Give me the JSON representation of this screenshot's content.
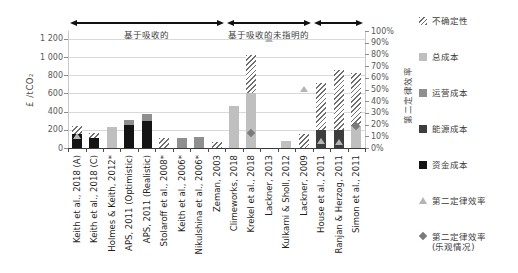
{
  "chart_data": {
    "type": "bar",
    "title": "",
    "left_axis": {
      "label": "£ /tCO₂",
      "min": 0,
      "max": 1200,
      "step": 200,
      "ticks": [
        {
          "label": "1 200",
          "value": 1200
        },
        {
          "label": "1 000",
          "value": 1000
        },
        {
          "label": "800",
          "value": 800
        },
        {
          "label": "600",
          "value": 600
        },
        {
          "label": "400",
          "value": 400
        },
        {
          "label": "200",
          "value": 200
        },
        {
          "label": "0",
          "value": 0
        }
      ]
    },
    "right_axis": {
      "label": "第二定律效率",
      "min": 0,
      "max": 100,
      "step": 10,
      "ticks": [
        {
          "label": "100%",
          "value": 100
        },
        {
          "label": "90%",
          "value": 90
        },
        {
          "label": "80%",
          "value": 80
        },
        {
          "label": "70%",
          "value": 70
        },
        {
          "label": "60%",
          "value": 60
        },
        {
          "label": "50%",
          "value": 50
        },
        {
          "label": "40%",
          "value": 40
        },
        {
          "label": "30%",
          "value": 30
        },
        {
          "label": "20%",
          "value": 20
        },
        {
          "label": "10%",
          "value": 10
        },
        {
          "label": "0%",
          "value": 0
        }
      ]
    },
    "groups": [
      {
        "label": "基于吸收的",
        "from": 0,
        "to": 8
      },
      {
        "label": "基于吸收的未指明的",
        "from": 9,
        "to": 13
      },
      {
        "label": "",
        "from": 14,
        "to": 16
      }
    ],
    "categories": [
      "Keith et al., 2018 (A)",
      "Keith et al., 2018 (C)",
      "Holmes & Keith, 2012*",
      "APS, 2011 (Optimistic)",
      "APS, 2011 (Realistic)",
      "Stolaroff et al., 2008*",
      "Keith et al., 2006*",
      "Nikulshina et al., 2006*",
      "Zeman, 2003",
      "Climeworks, 2018",
      "Krekel et al., 2018",
      "Lackner, 2013",
      "Kulkarni & Sholl, 2012",
      "Lackner, 2009",
      "House et al., 2011",
      "Ranjan & Herzog, 2011",
      "Simon et al., 2011"
    ],
    "bars": [
      {
        "category": "Keith et al., 2018 (A)",
        "segments": [
          {
            "type": "capital",
            "value": 150
          },
          {
            "type": "uncertainty",
            "value": 90
          }
        ],
        "second_law_efficiency_pct": 10,
        "second_law_efficiency_optimistic_pct": null
      },
      {
        "category": "Keith et al., 2018 (C)",
        "segments": [
          {
            "type": "capital",
            "value": 110
          },
          {
            "type": "uncertainty",
            "value": 60
          }
        ],
        "second_law_efficiency_pct": null,
        "second_law_efficiency_optimistic_pct": null
      },
      {
        "category": "Holmes & Keith, 2012*",
        "segments": [
          {
            "type": "total",
            "value": 230
          }
        ],
        "second_law_efficiency_pct": null,
        "second_law_efficiency_optimistic_pct": null
      },
      {
        "category": "APS, 2011 (Optimistic)",
        "segments": [
          {
            "type": "capital",
            "value": 250
          },
          {
            "type": "operating",
            "value": 60
          }
        ],
        "second_law_efficiency_pct": null,
        "second_law_efficiency_optimistic_pct": null
      },
      {
        "category": "APS, 2011 (Realistic)",
        "segments": [
          {
            "type": "capital",
            "value": 300
          },
          {
            "type": "operating",
            "value": 75
          }
        ],
        "second_law_efficiency_pct": null,
        "second_law_efficiency_optimistic_pct": null
      },
      {
        "category": "Stolaroff et al., 2008*",
        "segments": [
          {
            "type": "uncertainty",
            "value": 110
          }
        ],
        "second_law_efficiency_pct": null,
        "second_law_efficiency_optimistic_pct": null
      },
      {
        "category": "Keith et al., 2006*",
        "segments": [
          {
            "type": "operating",
            "value": 110
          }
        ],
        "second_law_efficiency_pct": null,
        "second_law_efficiency_optimistic_pct": null
      },
      {
        "category": "Nikulshina et al., 2006*",
        "segments": [
          {
            "type": "operating",
            "value": 125
          }
        ],
        "second_law_efficiency_pct": null,
        "second_law_efficiency_optimistic_pct": null
      },
      {
        "category": "Zeman, 2003",
        "segments": [
          {
            "type": "uncertainty",
            "value": 65
          }
        ],
        "second_law_efficiency_pct": null,
        "second_law_efficiency_optimistic_pct": null
      },
      {
        "category": "Climeworks, 2018",
        "segments": [
          {
            "type": "total",
            "value": 460
          }
        ],
        "second_law_efficiency_pct": null,
        "second_law_efficiency_optimistic_pct": null
      },
      {
        "category": "Krekel et al., 2018",
        "segments": [
          {
            "type": "total",
            "value": 600
          },
          {
            "type": "uncertainty",
            "value": 420
          }
        ],
        "second_law_efficiency_pct": null,
        "second_law_efficiency_optimistic_pct": 13
      },
      {
        "category": "Lackner, 2013",
        "segments": [],
        "second_law_efficiency_pct": 93,
        "second_law_efficiency_optimistic_pct": null
      },
      {
        "category": "Kulkarni & Sholl, 2012",
        "segments": [
          {
            "type": "total",
            "value": 80
          }
        ],
        "second_law_efficiency_pct": null,
        "second_law_efficiency_optimistic_pct": null
      },
      {
        "category": "Lackner, 2009",
        "segments": [
          {
            "type": "uncertainty",
            "value": 150
          }
        ],
        "second_law_efficiency_pct": 50,
        "second_law_efficiency_optimistic_pct": null
      },
      {
        "category": "House et al., 2011",
        "segments": [
          {
            "type": "energy",
            "value": 195
          },
          {
            "type": "uncertainty",
            "value": 520
          }
        ],
        "second_law_efficiency_pct": 6,
        "second_law_efficiency_optimistic_pct": null
      },
      {
        "category": "Ranjan & Herzog, 2011",
        "segments": [
          {
            "type": "energy",
            "value": 200
          },
          {
            "type": "uncertainty",
            "value": 660
          }
        ],
        "second_law_efficiency_pct": 5,
        "second_law_efficiency_optimistic_pct": null
      },
      {
        "category": "Simon et al., 2011",
        "segments": [
          {
            "type": "total",
            "value": 240
          },
          {
            "type": "uncertainty",
            "value": 590
          }
        ],
        "second_law_efficiency_pct": null,
        "second_law_efficiency_optimistic_pct": 19
      }
    ]
  },
  "legend": {
    "items": [
      {
        "swatch": "uncertainty",
        "label": "不确定性"
      },
      {
        "swatch": "total-cost",
        "label": "总成本"
      },
      {
        "swatch": "operating-cost",
        "label": "运营成本"
      },
      {
        "swatch": "energy-cost",
        "label": "能源成本"
      },
      {
        "swatch": "capital-cost",
        "label": "资金成本"
      },
      {
        "swatch": "second-law-efficiency",
        "label": "第二定律效率"
      },
      {
        "swatch": "second-law-efficiency-optimistic",
        "label": "第二定律效率",
        "label2": "(乐观情况)"
      }
    ]
  },
  "colors": {
    "total_cost": "#bfbfbf",
    "operating_cost": "#8f8f8f",
    "energy_cost": "#3d3d3d",
    "capital_cost": "#141414",
    "uncertainty_stripe": "#6f6f6f",
    "grid": "#d9d9d9",
    "axis_text": "#595959",
    "category_text": "#1f1f1f",
    "triangle_marker": "#b5b5b5",
    "diamond_marker": "#7a7a7a",
    "arrow": "#111111"
  }
}
